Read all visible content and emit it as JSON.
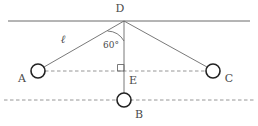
{
  "figure": {
    "type": "geometry-diagram",
    "title": "",
    "stroke_color": "#6a6a6a",
    "dash_color": "#8a8a8a",
    "label_color": "#4a4a4a",
    "background": "#ffffff"
  },
  "labels": {
    "apex": "D",
    "left_node": "A",
    "right_node": "C",
    "bottom_node": "B",
    "foot": "E",
    "length": "ℓ",
    "angle": "60°"
  },
  "geometry": {
    "points": {
      "D": {
        "x": 124,
        "y": 21
      },
      "A": {
        "x": 38,
        "y": 71
      },
      "C": {
        "x": 213,
        "y": 71
      },
      "B": {
        "x": 124,
        "y": 100
      },
      "E": {
        "x": 124,
        "y": 71
      }
    },
    "circle_radius": 7,
    "top_line": {
      "x1": 8,
      "y1": 21,
      "x2": 250,
      "y2": 21
    },
    "middle_dashed_line": {
      "x1": 33,
      "y1": 71,
      "x2": 217,
      "y2": 71
    },
    "bottom_dashed_line": {
      "x1": 4,
      "y1": 100,
      "x2": 254,
      "y2": 100
    },
    "angle_value_degrees": 60,
    "right_angle_at": "E"
  }
}
